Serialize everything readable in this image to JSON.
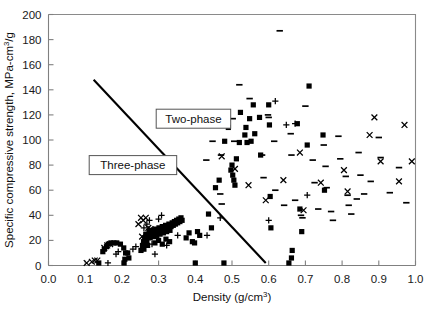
{
  "chart_data": {
    "type": "scatter",
    "title": "",
    "xlabel": "Density (g/cm3)",
    "xlabel_base": "Density (g/cm",
    "xlabel_sup": "3",
    "xlabel_tail": ")",
    "ylabel": "Specific compressive strength, MPa-cm3/g",
    "ylabel_base": "Specific compressive strength, MPa-cm",
    "ylabel_sup": "3",
    "ylabel_tail": "/g",
    "xlim": [
      0.0,
      1.0
    ],
    "ylim": [
      0,
      200
    ],
    "xticks": [
      0.0,
      0.1,
      0.2,
      0.3,
      0.4,
      0.5,
      0.6,
      0.7,
      0.8,
      0.9,
      1.0
    ],
    "xticklabels": [
      "0.0",
      "0.1",
      "0.2",
      "0.3",
      "0.4",
      "0.5",
      "0.6",
      "0.7",
      "0.8",
      "0.9",
      "1.0"
    ],
    "yticks": [
      0,
      20,
      40,
      60,
      80,
      100,
      120,
      140,
      160,
      180,
      200
    ],
    "yticklabels": [
      "0",
      "20",
      "40",
      "60",
      "80",
      "100",
      "120",
      "140",
      "160",
      "180",
      "200"
    ],
    "grid": false,
    "legend": false,
    "marker_color": "#000000",
    "annotations": [
      {
        "name": "two-phase",
        "text": "Two-phase",
        "x": 0.395,
        "y": 117,
        "boxed": true
      },
      {
        "name": "three-phase",
        "text": "Three-phase",
        "x": 0.23,
        "y": 80,
        "boxed": true
      }
    ],
    "boundary_line": {
      "name": "phase-boundary",
      "x": [
        0.123,
        0.592
      ],
      "y": [
        148,
        2
      ]
    },
    "series": [
      {
        "name": "square",
        "marker": "square",
        "points": [
          [
            0.137,
            2
          ],
          [
            0.206,
            2
          ],
          [
            0.208,
            5
          ],
          [
            0.21,
            10
          ],
          [
            0.205,
            14
          ],
          [
            0.196,
            17
          ],
          [
            0.186,
            18
          ],
          [
            0.178,
            18
          ],
          [
            0.17,
            18
          ],
          [
            0.163,
            17
          ],
          [
            0.158,
            15
          ],
          [
            0.152,
            13
          ],
          [
            0.148,
            11
          ],
          [
            0.216,
            10
          ],
          [
            0.219,
            6
          ],
          [
            0.252,
            12
          ],
          [
            0.256,
            16
          ],
          [
            0.259,
            19
          ],
          [
            0.262,
            22
          ],
          [
            0.265,
            25
          ],
          [
            0.268,
            20
          ],
          [
            0.271,
            24
          ],
          [
            0.274,
            27
          ],
          [
            0.277,
            22
          ],
          [
            0.28,
            25
          ],
          [
            0.283,
            28
          ],
          [
            0.286,
            23
          ],
          [
            0.289,
            26
          ],
          [
            0.292,
            29
          ],
          [
            0.295,
            24
          ],
          [
            0.298,
            27
          ],
          [
            0.301,
            30
          ],
          [
            0.304,
            25
          ],
          [
            0.307,
            28
          ],
          [
            0.31,
            31
          ],
          [
            0.313,
            26
          ],
          [
            0.316,
            29
          ],
          [
            0.319,
            32
          ],
          [
            0.322,
            27
          ],
          [
            0.325,
            30
          ],
          [
            0.328,
            33
          ],
          [
            0.331,
            28
          ],
          [
            0.334,
            31
          ],
          [
            0.337,
            34
          ],
          [
            0.34,
            32
          ],
          [
            0.343,
            35
          ],
          [
            0.346,
            33
          ],
          [
            0.349,
            36
          ],
          [
            0.352,
            34
          ],
          [
            0.355,
            37
          ],
          [
            0.358,
            35
          ],
          [
            0.361,
            38
          ],
          [
            0.364,
            36
          ],
          [
            0.29,
            18
          ],
          [
            0.3,
            20
          ],
          [
            0.31,
            17
          ],
          [
            0.32,
            21
          ],
          [
            0.33,
            19
          ],
          [
            0.27,
            16
          ],
          [
            0.26,
            13
          ],
          [
            0.375,
            22
          ],
          [
            0.383,
            26
          ],
          [
            0.392,
            19
          ],
          [
            0.4,
            2
          ],
          [
            0.398,
            18
          ],
          [
            0.406,
            27
          ],
          [
            0.412,
            24
          ],
          [
            0.436,
            41
          ],
          [
            0.444,
            30
          ],
          [
            0.455,
            62
          ],
          [
            0.465,
            68
          ],
          [
            0.478,
            2
          ],
          [
            0.48,
            99
          ],
          [
            0.49,
            110
          ],
          [
            0.497,
            76
          ],
          [
            0.5,
            80
          ],
          [
            0.502,
            72
          ],
          [
            0.505,
            68
          ],
          [
            0.508,
            64
          ],
          [
            0.512,
            85
          ],
          [
            0.52,
            98
          ],
          [
            0.523,
            122
          ],
          [
            0.535,
            104
          ],
          [
            0.538,
            110
          ],
          [
            0.541,
            98
          ],
          [
            0.548,
            117
          ],
          [
            0.552,
            99
          ],
          [
            0.558,
            128
          ],
          [
            0.562,
            105
          ],
          [
            0.575,
            118
          ],
          [
            0.578,
            88
          ],
          [
            0.6,
            128
          ],
          [
            0.602,
            112
          ],
          [
            0.604,
            55
          ],
          [
            0.606,
            30
          ],
          [
            0.655,
            2
          ],
          [
            0.662,
            6
          ],
          [
            0.664,
            12
          ],
          [
            0.678,
            113
          ],
          [
            0.685,
            45
          ],
          [
            0.69,
            27
          ],
          [
            0.705,
            96
          ],
          [
            0.71,
            143
          ],
          [
            0.748,
            104
          ],
          [
            0.752,
            60
          ]
        ]
      },
      {
        "name": "dash",
        "marker": "dash",
        "points": [
          [
            0.63,
            187
          ],
          [
            0.52,
            144
          ],
          [
            0.548,
            133
          ],
          [
            0.445,
            122
          ],
          [
            0.447,
            99
          ],
          [
            0.502,
            117
          ],
          [
            0.506,
            99
          ],
          [
            0.598,
            120
          ],
          [
            0.6,
            118
          ],
          [
            0.66,
            105
          ],
          [
            0.662,
            88
          ],
          [
            0.7,
            127
          ],
          [
            0.72,
            84
          ],
          [
            0.725,
            66
          ],
          [
            0.75,
            96
          ],
          [
            0.755,
            79
          ],
          [
            0.758,
            62
          ],
          [
            0.79,
            103
          ],
          [
            0.795,
            85
          ],
          [
            0.81,
            71
          ],
          [
            0.815,
            56
          ],
          [
            0.818,
            48
          ],
          [
            0.845,
            90
          ],
          [
            0.85,
            72
          ],
          [
            0.86,
            57
          ],
          [
            0.878,
            67
          ],
          [
            0.9,
            102
          ],
          [
            0.905,
            86
          ],
          [
            0.93,
            58
          ],
          [
            0.955,
            78
          ],
          [
            0.975,
            50
          ],
          [
            0.43,
            84
          ],
          [
            0.47,
            88
          ],
          [
            0.468,
            57
          ],
          [
            0.472,
            49
          ],
          [
            0.582,
            88
          ],
          [
            0.586,
            70
          ],
          [
            0.615,
            99
          ],
          [
            0.618,
            60
          ],
          [
            0.642,
            48
          ],
          [
            0.672,
            52
          ],
          [
            0.688,
            40
          ],
          [
            0.692,
            38
          ],
          [
            0.735,
            45
          ],
          [
            0.77,
            43
          ],
          [
            0.775,
            36
          ],
          [
            0.825,
            41
          ],
          [
            0.84,
            53
          ]
        ]
      },
      {
        "name": "cross-x",
        "marker": "x",
        "points": [
          [
            0.104,
            2
          ],
          [
            0.118,
            3
          ],
          [
            0.126,
            4
          ],
          [
            0.133,
            4
          ],
          [
            0.152,
            14
          ],
          [
            0.16,
            16
          ],
          [
            0.168,
            17
          ],
          [
            0.245,
            33
          ],
          [
            0.252,
            38
          ],
          [
            0.258,
            36
          ],
          [
            0.265,
            38
          ],
          [
            0.272,
            30
          ],
          [
            0.278,
            29
          ],
          [
            0.255,
            23
          ],
          [
            0.262,
            21
          ],
          [
            0.472,
            87
          ],
          [
            0.508,
            77
          ],
          [
            0.545,
            64
          ],
          [
            0.592,
            52
          ],
          [
            0.64,
            68
          ],
          [
            0.685,
            90
          ],
          [
            0.695,
            44
          ],
          [
            0.742,
            66
          ],
          [
            0.805,
            76
          ],
          [
            0.815,
            59
          ],
          [
            0.875,
            104
          ],
          [
            0.888,
            118
          ],
          [
            0.905,
            83
          ],
          [
            0.955,
            67
          ],
          [
            0.97,
            112
          ],
          [
            0.99,
            83
          ]
        ]
      },
      {
        "name": "plus",
        "marker": "plus",
        "points": [
          [
            0.162,
            2
          ],
          [
            0.184,
            9
          ],
          [
            0.19,
            11
          ],
          [
            0.23,
            13
          ],
          [
            0.238,
            15
          ],
          [
            0.26,
            30
          ],
          [
            0.268,
            33
          ],
          [
            0.275,
            36
          ],
          [
            0.282,
            17
          ],
          [
            0.29,
            9
          ],
          [
            0.3,
            37
          ],
          [
            0.308,
            40
          ],
          [
            0.322,
            16
          ],
          [
            0.352,
            24
          ],
          [
            0.432,
            24
          ],
          [
            0.468,
            38
          ],
          [
            0.6,
            36
          ],
          [
            0.618,
            131
          ],
          [
            0.648,
            112
          ],
          [
            0.672,
            113
          ],
          [
            0.705,
            56
          ]
        ]
      }
    ]
  }
}
